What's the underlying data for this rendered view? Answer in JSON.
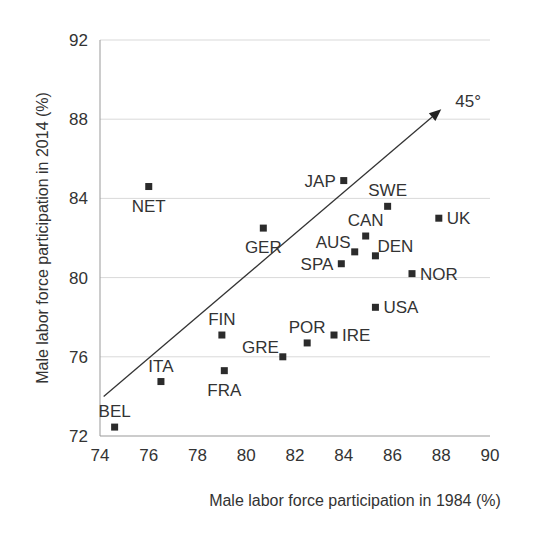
{
  "chart_data": {
    "type": "scatter",
    "title": "",
    "xlabel": "Male labor force participation in 1984 (%)",
    "ylabel": "Male labor force participation in 2014 (%)",
    "xlim": [
      74,
      90
    ],
    "ylim": [
      72,
      92
    ],
    "xticks": [
      74,
      76,
      78,
      80,
      82,
      84,
      86,
      88,
      90
    ],
    "yticks": [
      72,
      76,
      80,
      84,
      88,
      92
    ],
    "grid": "horizontal",
    "legend": "none",
    "marker_color": "#2b2b2b",
    "grid_color": "#d9d9d9",
    "axis_color": "#999999",
    "points": [
      {
        "label": "NET",
        "x": 76.0,
        "y": 84.6,
        "label_pos": "below"
      },
      {
        "label": "JAP",
        "x": 84.0,
        "y": 84.9,
        "label_pos": "left"
      },
      {
        "label": "SWE",
        "x": 85.8,
        "y": 83.6,
        "label_pos": "above"
      },
      {
        "label": "UK",
        "x": 87.9,
        "y": 83.0,
        "label_pos": "right"
      },
      {
        "label": "GER",
        "x": 80.7,
        "y": 82.5,
        "label_pos": "below"
      },
      {
        "label": "CAN",
        "x": 84.9,
        "y": 82.1,
        "label_pos": "above"
      },
      {
        "label": "AUS",
        "x": 84.45,
        "y": 81.3,
        "label_pos": "upper-left"
      },
      {
        "label": "DEN",
        "x": 85.3,
        "y": 81.1,
        "label_pos": "upper-right"
      },
      {
        "label": "SPA",
        "x": 83.9,
        "y": 80.7,
        "label_pos": "left"
      },
      {
        "label": "NOR",
        "x": 86.8,
        "y": 80.2,
        "label_pos": "right"
      },
      {
        "label": "USA",
        "x": 85.3,
        "y": 78.5,
        "label_pos": "right"
      },
      {
        "label": "FIN",
        "x": 79.0,
        "y": 77.1,
        "label_pos": "above"
      },
      {
        "label": "IRE",
        "x": 83.6,
        "y": 77.1,
        "label_pos": "right"
      },
      {
        "label": "POR",
        "x": 82.5,
        "y": 76.7,
        "label_pos": "above"
      },
      {
        "label": "GRE",
        "x": 81.5,
        "y": 76.0,
        "label_pos": "upper-left"
      },
      {
        "label": "FRA",
        "x": 79.1,
        "y": 75.3,
        "label_pos": "below"
      },
      {
        "label": "ITA",
        "x": 76.5,
        "y": 74.75,
        "label_pos": "above"
      },
      {
        "label": "BEL",
        "x": 74.6,
        "y": 72.45,
        "label_pos": "above"
      }
    ],
    "annotations": [
      {
        "type": "arrow",
        "text": "45°",
        "from": [
          74.15,
          74.0
        ],
        "to": [
          88.0,
          88.5
        ]
      }
    ]
  }
}
